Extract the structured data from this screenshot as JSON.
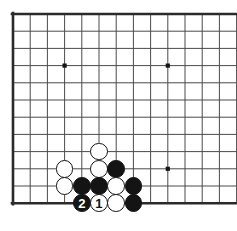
{
  "figure": {
    "caption": "",
    "background_color": "#ffffff"
  },
  "board": {
    "name": "go-board",
    "line_color": "#4a4a4a",
    "border_color": "#2a2a2a",
    "star_color": "#141414",
    "cell_size": 17.2,
    "origin_x": 13,
    "origin_y": 14,
    "cols": 14,
    "rows": 12,
    "border_edges": [
      "left",
      "top",
      "bottom"
    ],
    "cropped_edges": [
      "right"
    ],
    "star_points": [
      {
        "name": "star-point-upper-left",
        "col": 3,
        "row": 3
      },
      {
        "name": "star-point-upper-right",
        "col": 9,
        "row": 3
      },
      {
        "name": "star-point-lower-right",
        "col": 9,
        "row": 9
      }
    ]
  },
  "stones": [
    {
      "name": "stone-white-c5r8",
      "color": "white",
      "col": 5,
      "row": 8,
      "label": ""
    },
    {
      "name": "stone-white-c3r9",
      "color": "white",
      "col": 3,
      "row": 9,
      "label": ""
    },
    {
      "name": "stone-white-c5r9",
      "color": "white",
      "col": 5,
      "row": 9,
      "label": ""
    },
    {
      "name": "stone-black-c6r9",
      "color": "black",
      "col": 6,
      "row": 9,
      "label": ""
    },
    {
      "name": "stone-white-c3r10",
      "color": "white",
      "col": 3,
      "row": 10,
      "label": ""
    },
    {
      "name": "stone-black-c4r10",
      "color": "black",
      "col": 4,
      "row": 10,
      "label": ""
    },
    {
      "name": "stone-black-c5r10",
      "color": "black",
      "col": 5,
      "row": 10,
      "label": ""
    },
    {
      "name": "stone-white-c6r10",
      "color": "white",
      "col": 6,
      "row": 10,
      "label": ""
    },
    {
      "name": "stone-black-c7r10",
      "color": "black",
      "col": 7,
      "row": 10,
      "label": ""
    },
    {
      "name": "stone-black-move-2",
      "color": "black",
      "col": 4,
      "row": 11,
      "label": "2"
    },
    {
      "name": "stone-white-move-1",
      "color": "white",
      "col": 5,
      "row": 11,
      "label": "1"
    },
    {
      "name": "stone-white-c6r11",
      "color": "white",
      "col": 6,
      "row": 11,
      "label": ""
    },
    {
      "name": "stone-black-c7r11",
      "color": "black",
      "col": 7,
      "row": 11,
      "label": ""
    }
  ],
  "moves": {
    "move_1": {
      "number": "1",
      "color": "white"
    },
    "move_2": {
      "number": "2",
      "color": "black"
    }
  }
}
